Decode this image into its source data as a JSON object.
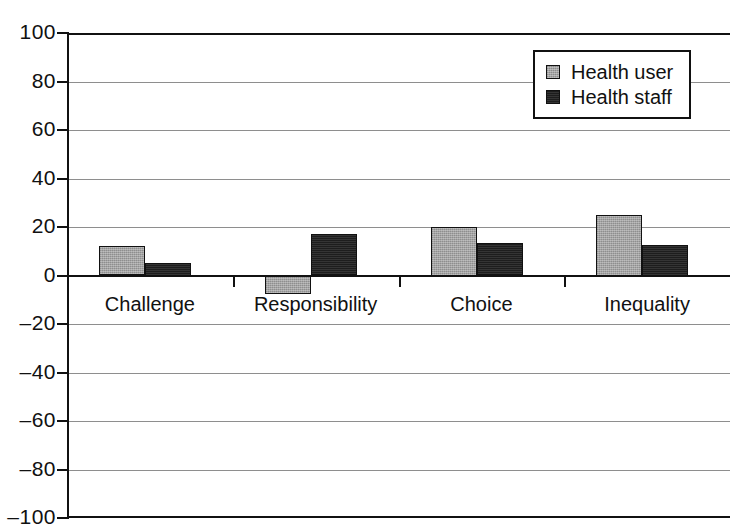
{
  "chart_data": {
    "type": "bar",
    "title": "",
    "xlabel": "",
    "ylabel": "",
    "ylim": [
      -100,
      100
    ],
    "ytick_labels": [
      "100",
      "80",
      "60",
      "40",
      "20",
      "0",
      "–20",
      "–40",
      "–60",
      "–80",
      "–100"
    ],
    "ytick_values": [
      100,
      80,
      60,
      40,
      20,
      0,
      -20,
      -40,
      -60,
      -80,
      -100
    ],
    "grid": true,
    "legend_position": "top-right",
    "categories": [
      "Challenge",
      "Responsibility",
      "Choice",
      "Inequality"
    ],
    "series": [
      {
        "name": "Health user",
        "values": [
          12,
          -7.5,
          20,
          25
        ],
        "color": "#a3a3a3"
      },
      {
        "name": "Health staff",
        "values": [
          5,
          17,
          13.5,
          12.5
        ],
        "color": "#1d1d1d"
      }
    ]
  },
  "legend": {
    "items": [
      {
        "label": "Health user"
      },
      {
        "label": "Health staff"
      }
    ]
  },
  "colors": {
    "series_light": "#a3a3a3",
    "series_dark": "#1d1d1d",
    "axis": "#111111",
    "gridline": "#8e8e8e",
    "background": "#ffffff"
  }
}
